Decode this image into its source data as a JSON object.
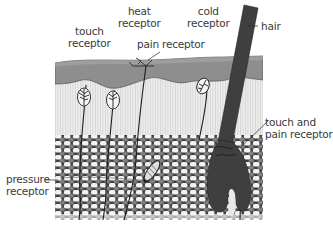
{
  "diagram": {
    "labels": {
      "touch_receptor": [
        "touch",
        "receptor"
      ],
      "heat_receptor": [
        "heat",
        "receptor"
      ],
      "pain_receptor": "pain receptor",
      "cold_receptor": [
        "cold",
        "receptor"
      ],
      "hair": "hair",
      "touch_and_pain_receptor": [
        "touch and",
        "pain receptor"
      ],
      "pressure_receptor": [
        "pressure",
        "receptor"
      ]
    },
    "layers": [
      "epidermis",
      "dermis",
      "subcutaneous fat"
    ],
    "colors": {
      "epidermis": "#8f8f8f",
      "epidermis_top": "#a8a8a8",
      "dermis": "#e9e9e9",
      "dermis_stripe": "#d6d6d6",
      "fat_bg": "#4a4a4a",
      "fat_cell": "#f4f4f4",
      "hair": "#3f3f3f",
      "nerve": "#1e1e1e",
      "label_text": "#3a3a3a"
    }
  }
}
